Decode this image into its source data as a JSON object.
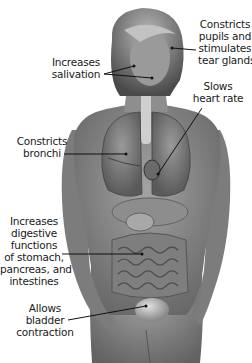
{
  "diagram": {
    "labels": [
      {
        "id": "eyes",
        "lines": [
          "Constricts",
          "pupils and",
          "stimulates",
          "tear glands"
        ]
      },
      {
        "id": "salivation",
        "lines": [
          "Increases",
          "salivation"
        ]
      },
      {
        "id": "heart",
        "lines": [
          "Slows",
          "heart rate"
        ]
      },
      {
        "id": "bronchi",
        "lines": [
          "Constricts",
          "bronchi"
        ]
      },
      {
        "id": "digestion",
        "lines": [
          "Increases",
          "digestive",
          "functions",
          "of stomach,",
          "pancreas, and",
          "intestines"
        ]
      },
      {
        "id": "bladder",
        "lines": [
          "Allows",
          "bladder",
          "contraction"
        ]
      }
    ],
    "colors": {
      "background": "#ffffff",
      "skin": "#8a8a8a",
      "skin_dark": "#5e5e5e",
      "hair": "#6b6b6b",
      "organs": "#7a7a7a",
      "leader_line": "#111111",
      "text": "#1a1a1a"
    }
  }
}
